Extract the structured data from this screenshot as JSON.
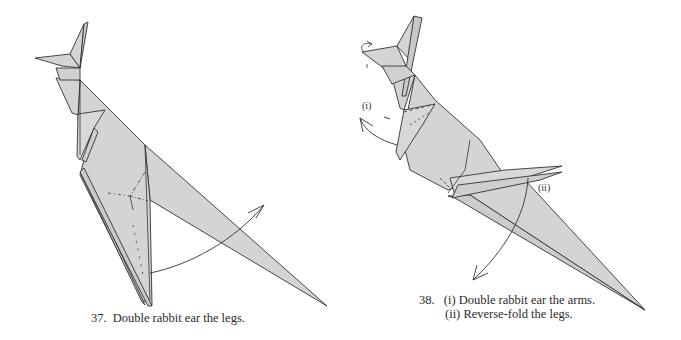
{
  "steps": [
    {
      "number": "37.",
      "instruction": "Double rabbit ear the legs.",
      "subject": "origami kangaroo",
      "figure": {
        "fill_color": "#d4d4d4",
        "line_color": "#333333",
        "arrow": "curved arrow from leg toward upper right"
      }
    },
    {
      "number": "38.",
      "instructions": [
        {
          "label": "(i)",
          "text": "Double rabbit ear the arms."
        },
        {
          "label": "(ii)",
          "text": "Reverse-fold the legs."
        }
      ],
      "diagram_labels": {
        "i": "(i)",
        "ii": "(ii)"
      },
      "subject": "origami kangaroo",
      "figure": {
        "fill_color": "#d4d4d4",
        "line_color": "#333333",
        "arrows": [
          "curved arrow at arms pointing left",
          "curved arrow at legs pointing down",
          "small curl arrow at snout"
        ]
      }
    }
  ]
}
